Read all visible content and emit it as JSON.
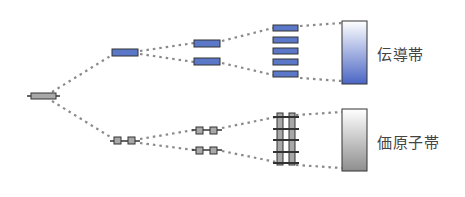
{
  "labels": {
    "conduction_band": "伝導帯",
    "valence_band": "価原子帯"
  },
  "colors": {
    "orbital_blue": "#5b78c8",
    "orbital_gray": "#a8a8a8",
    "outline": "#333333",
    "dots": "#8a8a8a"
  }
}
